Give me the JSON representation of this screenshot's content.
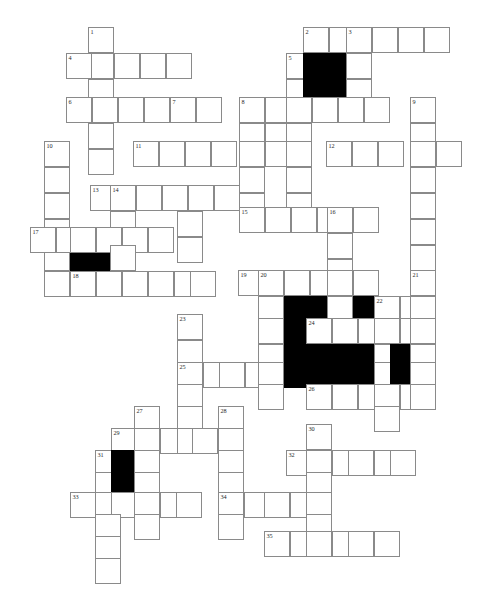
{
  "document": {
    "kind": "crossword-puzzle-grid",
    "title": "",
    "width": 481,
    "height": 602,
    "background_color": "#ffffff",
    "grid_line_color": "#8a8a8a",
    "block_color": "#000000",
    "cell_size": 26,
    "origin_x": 40,
    "origin_y": 27,
    "columns": 17,
    "rows": 22
  },
  "legend": {
    "white_cell": "empty answer cell, letters to be filled in",
    "black_cell": "blocked cell",
    "number": "clue start number printed in top-left of cell"
  },
  "clue_numbers": [
    1,
    2,
    3,
    4,
    5,
    6,
    7,
    8,
    9,
    10,
    11,
    12,
    13,
    14,
    15,
    16,
    17,
    18,
    19,
    20,
    21,
    22,
    23,
    24,
    25,
    26,
    27,
    28,
    29,
    30,
    31,
    32,
    33,
    34,
    35
  ],
  "entries": [
    {
      "number": 1,
      "direction": "down",
      "col": 2,
      "row": 0,
      "length": 7
    },
    {
      "number": 2,
      "direction": "across",
      "col": 10,
      "row": 0,
      "length": 6
    },
    {
      "number": 3,
      "direction": "down",
      "col": 12,
      "row": 0,
      "length": 5
    },
    {
      "number": 4,
      "direction": "across",
      "col": 1,
      "row": 1,
      "length": 5
    },
    {
      "number": 5,
      "direction": "down",
      "col": 9,
      "row": 1,
      "length": 4
    },
    {
      "number": 6,
      "direction": "across",
      "col": 1,
      "row": 3,
      "length": 5
    },
    {
      "number": 7,
      "direction": "down",
      "col": 5,
      "row": 3,
      "length": 7
    },
    {
      "number": 8,
      "direction": "down",
      "col": 8,
      "row": 3,
      "length": 8
    },
    {
      "number": 9,
      "direction": "down",
      "col": 15,
      "row": 3,
      "length": 7
    },
    {
      "number": 10,
      "direction": "down",
      "col": 0,
      "row": 5,
      "length": 7
    },
    {
      "number": 11,
      "direction": "across",
      "col": 3,
      "row": 5,
      "length": 7
    },
    {
      "number": 12,
      "direction": "across",
      "col": 11,
      "row": 5,
      "length": 6
    },
    {
      "number": 13,
      "direction": "across",
      "col": 2,
      "row": 7,
      "length": 6
    },
    {
      "number": 14,
      "direction": "down",
      "col": 3,
      "row": 7,
      "length": 6
    },
    {
      "number": 15,
      "direction": "across",
      "col": 8,
      "row": 9,
      "length": 5
    },
    {
      "number": 16,
      "direction": "down",
      "col": 11,
      "row": 9,
      "length": 8
    },
    {
      "number": 17,
      "direction": "across",
      "col": 0,
      "row": 11,
      "length": 6
    },
    {
      "number": 18,
      "direction": "across",
      "col": 1,
      "row": 13,
      "length": 6
    },
    {
      "number": 19,
      "direction": "across",
      "col": 8,
      "row": 13,
      "length": 7
    },
    {
      "number": 20,
      "direction": "down",
      "col": 9,
      "row": 13,
      "length": 7
    },
    {
      "number": 21,
      "direction": "down",
      "col": 15,
      "row": 13,
      "length": 5
    },
    {
      "number": 22,
      "direction": "down",
      "col": 13,
      "row": 14,
      "length": 4
    },
    {
      "number": 23,
      "direction": "down",
      "col": 6,
      "row": 16,
      "length": 7
    },
    {
      "number": 24,
      "direction": "across",
      "col": 11,
      "row": 15,
      "length": 6
    },
    {
      "number": 25,
      "direction": "across",
      "col": 6,
      "row": 18,
      "length": 7
    },
    {
      "number": 26,
      "direction": "across",
      "col": 10,
      "row": 19,
      "length": 7
    },
    {
      "number": 27,
      "direction": "down",
      "col": 5,
      "row": 21,
      "length": 6
    },
    {
      "number": 28,
      "direction": "down",
      "col": 7,
      "row": 21,
      "length": 8
    },
    {
      "number": 29,
      "direction": "across",
      "col": 4,
      "row": 22,
      "length": 6
    },
    {
      "number": 30,
      "direction": "down",
      "col": 10,
      "row": 21,
      "length": 8
    },
    {
      "number": 31,
      "direction": "down",
      "col": 3,
      "row": 23,
      "length": 8
    },
    {
      "number": 32,
      "direction": "across",
      "col": 9,
      "row": 23,
      "length": 6
    },
    {
      "number": 33,
      "direction": "across",
      "col": 2,
      "row": 25,
      "length": 6
    },
    {
      "number": 34,
      "direction": "across",
      "col": 7,
      "row": 25,
      "length": 5
    },
    {
      "number": 35,
      "direction": "across",
      "col": 9,
      "row": 27,
      "length": 6
    }
  ],
  "cells": [
    {
      "x": 88,
      "y": 27,
      "number": "1"
    },
    {
      "x": 88,
      "y": 53
    },
    {
      "x": 88,
      "y": 79
    },
    {
      "x": 88,
      "y": 105
    },
    {
      "x": 88,
      "y": 131
    },
    {
      "x": 66,
      "y": 53,
      "number": "4"
    },
    {
      "x": 114,
      "y": 53
    },
    {
      "x": 140,
      "y": 53
    },
    {
      "x": 166,
      "y": 53
    },
    {
      "x": 303,
      "y": 27,
      "number": "2"
    },
    {
      "x": 329,
      "y": 27
    },
    {
      "x": 346,
      "y": 27,
      "number": "3"
    },
    {
      "x": 372,
      "y": 27
    },
    {
      "x": 398,
      "y": 27
    },
    {
      "x": 424,
      "y": 27
    },
    {
      "x": 286,
      "y": 53,
      "number": "5"
    },
    {
      "x": 303,
      "y": 53,
      "black": true
    },
    {
      "x": 329,
      "y": 53,
      "black": true
    },
    {
      "x": 346,
      "y": 53
    },
    {
      "x": 286,
      "y": 79
    },
    {
      "x": 303,
      "y": 79,
      "black": true
    },
    {
      "x": 329,
      "y": 79,
      "black": true
    },
    {
      "x": 346,
      "y": 79
    },
    {
      "x": 66,
      "y": 97,
      "number": "6"
    },
    {
      "x": 92,
      "y": 97
    },
    {
      "x": 118,
      "y": 97
    },
    {
      "x": 144,
      "y": 97
    },
    {
      "x": 170,
      "y": 97,
      "number": "7"
    },
    {
      "x": 196,
      "y": 97
    },
    {
      "x": 239,
      "y": 97,
      "number": "8"
    },
    {
      "x": 265,
      "y": 97
    },
    {
      "x": 286,
      "y": 97
    },
    {
      "x": 312,
      "y": 97
    },
    {
      "x": 338,
      "y": 97
    },
    {
      "x": 364,
      "y": 97
    },
    {
      "x": 410,
      "y": 97,
      "number": "9"
    },
    {
      "x": 239,
      "y": 123
    },
    {
      "x": 265,
      "y": 123
    },
    {
      "x": 286,
      "y": 123
    },
    {
      "x": 410,
      "y": 123
    },
    {
      "x": 88,
      "y": 123
    },
    {
      "x": 44,
      "y": 141,
      "number": "10"
    },
    {
      "x": 44,
      "y": 167
    },
    {
      "x": 44,
      "y": 193
    },
    {
      "x": 44,
      "y": 219
    },
    {
      "x": 44,
      "y": 245
    },
    {
      "x": 44,
      "y": 271
    },
    {
      "x": 133,
      "y": 141,
      "number": "11"
    },
    {
      "x": 159,
      "y": 141
    },
    {
      "x": 185,
      "y": 141
    },
    {
      "x": 211,
      "y": 141
    },
    {
      "x": 239,
      "y": 141
    },
    {
      "x": 265,
      "y": 141
    },
    {
      "x": 286,
      "y": 141
    },
    {
      "x": 326,
      "y": 141,
      "number": "12"
    },
    {
      "x": 352,
      "y": 141
    },
    {
      "x": 378,
      "y": 141
    },
    {
      "x": 410,
      "y": 141
    },
    {
      "x": 436,
      "y": 141
    },
    {
      "x": 88,
      "y": 149
    },
    {
      "x": 239,
      "y": 167
    },
    {
      "x": 286,
      "y": 167
    },
    {
      "x": 410,
      "y": 167
    },
    {
      "x": 90,
      "y": 185,
      "number": "13"
    },
    {
      "x": 110,
      "y": 185,
      "number": "14"
    },
    {
      "x": 136,
      "y": 185
    },
    {
      "x": 162,
      "y": 185
    },
    {
      "x": 188,
      "y": 185
    },
    {
      "x": 214,
      "y": 185
    },
    {
      "x": 239,
      "y": 193
    },
    {
      "x": 286,
      "y": 193
    },
    {
      "x": 410,
      "y": 193
    },
    {
      "x": 110,
      "y": 211
    },
    {
      "x": 177,
      "y": 211
    },
    {
      "x": 239,
      "y": 207,
      "number": "15"
    },
    {
      "x": 265,
      "y": 207
    },
    {
      "x": 291,
      "y": 207
    },
    {
      "x": 317,
      "y": 207
    },
    {
      "x": 327,
      "y": 207,
      "number": "16"
    },
    {
      "x": 353,
      "y": 207
    },
    {
      "x": 410,
      "y": 219
    },
    {
      "x": 410,
      "y": 245
    },
    {
      "x": 30,
      "y": 227,
      "number": "17"
    },
    {
      "x": 56,
      "y": 227
    },
    {
      "x": 70,
      "y": 227
    },
    {
      "x": 96,
      "y": 227
    },
    {
      "x": 122,
      "y": 227
    },
    {
      "x": 148,
      "y": 227
    },
    {
      "x": 327,
      "y": 233
    },
    {
      "x": 327,
      "y": 259
    },
    {
      "x": 70,
      "y": 253,
      "black": true
    },
    {
      "x": 96,
      "y": 253,
      "black": true
    },
    {
      "x": 110,
      "y": 245
    },
    {
      "x": 177,
      "y": 237
    },
    {
      "x": 70,
      "y": 271,
      "number": "18"
    },
    {
      "x": 96,
      "y": 271
    },
    {
      "x": 122,
      "y": 271
    },
    {
      "x": 148,
      "y": 271
    },
    {
      "x": 174,
      "y": 271
    },
    {
      "x": 190,
      "y": 271
    },
    {
      "x": 238,
      "y": 270,
      "number": "19"
    },
    {
      "x": 258,
      "y": 270,
      "number": "20"
    },
    {
      "x": 284,
      "y": 270
    },
    {
      "x": 310,
      "y": 270
    },
    {
      "x": 327,
      "y": 270
    },
    {
      "x": 353,
      "y": 270
    },
    {
      "x": 410,
      "y": 270,
      "number": "21"
    },
    {
      "x": 258,
      "y": 296
    },
    {
      "x": 284,
      "y": 296,
      "black": true
    },
    {
      "x": 310,
      "y": 296,
      "black": true
    },
    {
      "x": 327,
      "y": 296
    },
    {
      "x": 353,
      "y": 296,
      "black": true
    },
    {
      "x": 374,
      "y": 296,
      "number": "22"
    },
    {
      "x": 400,
      "y": 296
    },
    {
      "x": 410,
      "y": 296
    },
    {
      "x": 258,
      "y": 318
    },
    {
      "x": 284,
      "y": 318,
      "black": true
    },
    {
      "x": 306,
      "y": 318,
      "number": "24"
    },
    {
      "x": 332,
      "y": 318
    },
    {
      "x": 358,
      "y": 318
    },
    {
      "x": 374,
      "y": 318
    },
    {
      "x": 400,
      "y": 318
    },
    {
      "x": 410,
      "y": 318
    },
    {
      "x": 177,
      "y": 314,
      "number": "23"
    },
    {
      "x": 177,
      "y": 340
    },
    {
      "x": 258,
      "y": 344
    },
    {
      "x": 284,
      "y": 344,
      "black": true
    },
    {
      "x": 306,
      "y": 344,
      "black": true
    },
    {
      "x": 332,
      "y": 344,
      "black": true
    },
    {
      "x": 358,
      "y": 344,
      "black": true
    },
    {
      "x": 374,
      "y": 344
    },
    {
      "x": 390,
      "y": 344,
      "black": true
    },
    {
      "x": 410,
      "y": 344
    },
    {
      "x": 177,
      "y": 362,
      "number": "25"
    },
    {
      "x": 203,
      "y": 362
    },
    {
      "x": 219,
      "y": 362
    },
    {
      "x": 245,
      "y": 362
    },
    {
      "x": 258,
      "y": 362
    },
    {
      "x": 284,
      "y": 362,
      "black": true
    },
    {
      "x": 306,
      "y": 362,
      "black": true
    },
    {
      "x": 332,
      "y": 362,
      "black": true
    },
    {
      "x": 358,
      "y": 362,
      "black": true
    },
    {
      "x": 374,
      "y": 362
    },
    {
      "x": 390,
      "y": 362,
      "black": true
    },
    {
      "x": 410,
      "y": 362
    },
    {
      "x": 177,
      "y": 384
    },
    {
      "x": 258,
      "y": 384
    },
    {
      "x": 306,
      "y": 384,
      "number": "26"
    },
    {
      "x": 332,
      "y": 384
    },
    {
      "x": 358,
      "y": 384
    },
    {
      "x": 374,
      "y": 384
    },
    {
      "x": 400,
      "y": 384
    },
    {
      "x": 410,
      "y": 384
    },
    {
      "x": 374,
      "y": 406
    },
    {
      "x": 177,
      "y": 406
    },
    {
      "x": 134,
      "y": 406,
      "number": "27"
    },
    {
      "x": 218,
      "y": 406,
      "number": "28"
    },
    {
      "x": 111,
      "y": 428,
      "number": "29"
    },
    {
      "x": 134,
      "y": 428
    },
    {
      "x": 160,
      "y": 428
    },
    {
      "x": 177,
      "y": 428
    },
    {
      "x": 192,
      "y": 428
    },
    {
      "x": 218,
      "y": 428
    },
    {
      "x": 95,
      "y": 450,
      "number": "31"
    },
    {
      "x": 111,
      "y": 450,
      "black": true
    },
    {
      "x": 134,
      "y": 450
    },
    {
      "x": 218,
      "y": 450
    },
    {
      "x": 306,
      "y": 424,
      "number": "30"
    },
    {
      "x": 286,
      "y": 450,
      "number": "32"
    },
    {
      "x": 306,
      "y": 450
    },
    {
      "x": 332,
      "y": 450
    },
    {
      "x": 348,
      "y": 450
    },
    {
      "x": 374,
      "y": 450
    },
    {
      "x": 390,
      "y": 450
    },
    {
      "x": 95,
      "y": 472
    },
    {
      "x": 111,
      "y": 472,
      "black": true
    },
    {
      "x": 134,
      "y": 472
    },
    {
      "x": 218,
      "y": 472
    },
    {
      "x": 306,
      "y": 472
    },
    {
      "x": 70,
      "y": 492,
      "number": "33"
    },
    {
      "x": 95,
      "y": 492
    },
    {
      "x": 111,
      "y": 492
    },
    {
      "x": 134,
      "y": 492
    },
    {
      "x": 160,
      "y": 492
    },
    {
      "x": 176,
      "y": 492
    },
    {
      "x": 218,
      "y": 492,
      "number": "34"
    },
    {
      "x": 244,
      "y": 492
    },
    {
      "x": 264,
      "y": 492
    },
    {
      "x": 290,
      "y": 492
    },
    {
      "x": 306,
      "y": 492
    },
    {
      "x": 95,
      "y": 514
    },
    {
      "x": 134,
      "y": 514
    },
    {
      "x": 218,
      "y": 514
    },
    {
      "x": 306,
      "y": 514
    },
    {
      "x": 264,
      "y": 531,
      "number": "35"
    },
    {
      "x": 290,
      "y": 531
    },
    {
      "x": 306,
      "y": 531
    },
    {
      "x": 332,
      "y": 531
    },
    {
      "x": 348,
      "y": 531
    },
    {
      "x": 374,
      "y": 531
    },
    {
      "x": 95,
      "y": 536
    },
    {
      "x": 95,
      "y": 558
    }
  ]
}
